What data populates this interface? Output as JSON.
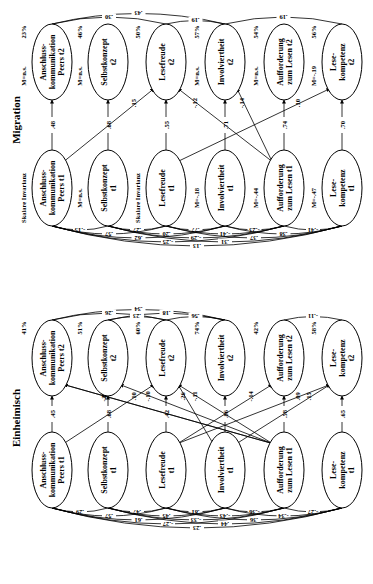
{
  "diagram": {
    "orientation": "rotated-90-ccw",
    "panels": [
      {
        "id": "migration",
        "title": "Migration",
        "t2_nodes": [
          {
            "label": [
              "Anschluss-",
              "kommunikation",
              "Peers t2"
            ],
            "r2": "23%",
            "mean": "M=n.s."
          },
          {
            "label": [
              "Selbstkonzept",
              "t2"
            ],
            "r2": "46%",
            "mean": "M=n.s."
          },
          {
            "label": [
              "Lesefreude",
              "t2"
            ],
            "r2": "50%",
            "mean": ""
          },
          {
            "label": [
              "Involviertheit",
              "t2"
            ],
            "r2": "57%",
            "mean": "M=n.s."
          },
          {
            "label": [
              "Aufforderung",
              "zum Lesen t2"
            ],
            "r2": "54%",
            "mean": "M=n.s."
          },
          {
            "label": [
              "Lese-",
              "kompetenz",
              "t2"
            ],
            "r2": "56%",
            "mean": "M=-.19"
          }
        ],
        "t1_nodes": [
          {
            "label": [
              "Anschluss-",
              "kommunikation",
              "Peers t1"
            ],
            "side": "Skalare Invarianz"
          },
          {
            "label": [
              "Selbstkonzept",
              "t1"
            ],
            "side": "M=n.s."
          },
          {
            "label": [
              "Lesefreude",
              "t1"
            ],
            "side": "Skalare Invarianz"
          },
          {
            "label": [
              "Involviertheit",
              "t1"
            ],
            "side": "M=-.18"
          },
          {
            "label": [
              "Aufforderung",
              "zum Lesen t1"
            ],
            "side": "M=-.44"
          },
          {
            "label": [
              "Lese-",
              "kompetenz",
              "t1"
            ],
            "side": "M=-.47"
          }
        ],
        "stability_paths": [
          ".48",
          ".68",
          ".55",
          ".71",
          ".74",
          ".70"
        ],
        "cross_paths": [
          {
            "from": "Anschlusskommunikation t1",
            "to": "Lesefreude t2",
            "value": ".15"
          },
          {
            "from": "Lesefreude t1",
            "to": "Lesekompetenz t2",
            "value": ".10"
          },
          {
            "from": "Aufforderung t1",
            "to": "Lesefreude t2",
            "value": "-.12"
          },
          {
            "from": "Aufforderung t1",
            "to": "Involviertheit t2",
            "value": "-.14"
          }
        ],
        "t2_correlations": [
          {
            "between": "AK t2 - Involviertheit t2",
            "value": ".43"
          },
          {
            "between": "AK t2 - Lesefreude t2",
            "value": ".30"
          },
          {
            "between": "Lesefreude t2 - Involviertheit t2",
            "value": ".19"
          },
          {
            "between": "Involviertheit t2 - Lesekompetenz t2",
            "value": ".19"
          }
        ],
        "t1_correlations": [
          "-.15",
          ".27",
          ".77",
          "-.23",
          "-.41",
          ".57",
          ".20",
          "-.41",
          ".38",
          ".62",
          "-.29",
          ".37",
          "-.25",
          ".31",
          ".13"
        ]
      },
      {
        "id": "einheimisch",
        "title": "Einheimisch",
        "t2_nodes": [
          {
            "label": [
              "Anschluss-",
              "kommunikation",
              "Peers t2"
            ],
            "r2": "41%"
          },
          {
            "label": [
              "Selbstkonzept",
              "t2"
            ],
            "r2": "51%"
          },
          {
            "label": [
              "Lesefreude",
              "t2"
            ],
            "r2": "60%"
          },
          {
            "label": [
              "Involviertheit",
              "t2"
            ],
            "r2": "74%"
          },
          {
            "label": [
              "Aufforderung",
              "zum Lesen t2"
            ],
            "r2": "42%"
          },
          {
            "label": [
              "Lese-",
              "kompetenz",
              "t2"
            ],
            "r2": "58%"
          }
        ],
        "t1_nodes": [
          {
            "label": [
              "Anschluss-",
              "kommunikation",
              "Peers t1"
            ]
          },
          {
            "label": [
              "Selbstkonzept",
              "t1"
            ]
          },
          {
            "label": [
              "Lesefreude",
              "t1"
            ]
          },
          {
            "label": [
              "Involviertheit",
              "t1"
            ]
          },
          {
            "label": [
              "Aufforderung",
              "zum Lesen t1"
            ]
          },
          {
            "label": [
              "Lese-",
              "kompetenz",
              "t1"
            ]
          }
        ],
        "stability_paths": [
          ".45",
          ".68",
          ".42",
          ".86",
          ".58",
          ".65"
        ],
        "cross_paths": [
          {
            "from": "Anschlusskommunikation t1",
            "to": "Lesefreude t2",
            "value": ".10"
          },
          {
            "from": "Aufforderung t1",
            "to": "AK t2",
            "value": "-.09"
          },
          {
            "from": "Aufforderung t1",
            "to": "AK t2",
            "value": ".21"
          },
          {
            "from": "Aufforderung t1",
            "to": "Selbstkonzept t2",
            "value": "-.10"
          },
          {
            "from": "Aufforderung t1",
            "to": "Lesefreude t2",
            "value": "-.11"
          },
          {
            "from": "Involviertheit t1",
            "to": "Lesefreude t2",
            "value": ".26"
          },
          {
            "from": "Lesefreude t1",
            "to": "Aufforderung t2",
            "value": "-.14"
          },
          {
            "from": "Lesefreude t1",
            "to": "Lesekompetenz t2",
            "value": ".09"
          },
          {
            "from": "Involviertheit t1",
            "to": "Lesekompetenz t2",
            "value": ".15"
          }
        ],
        "t2_correlations": [
          {
            "between": "AK t2 - Involviertheit t2",
            "value": ".34"
          },
          {
            "between": "AK t2 - Lesefreude t2",
            "value": ".26"
          },
          {
            "between": "Selbstkonzept t2 - Involviertheit t2",
            "value": ".18"
          },
          {
            "between": "Selbstkonzept t2 - Lesefreude t2",
            "value": ".23"
          },
          {
            "between": "Lesefreude t2 - Involviertheit t2",
            "value": ".56"
          },
          {
            "between": "Aufforderung t2 - Lesekompetenz t2",
            "value": "-.11"
          }
        ],
        "t1_correlations": [
          ".29",
          ".47",
          ".81",
          "-.36",
          "-.27",
          ".57",
          ".45",
          "-.43",
          "-.34",
          ".61",
          "-.33",
          ".36",
          "-.27",
          ".44",
          ".23"
        ]
      }
    ]
  }
}
